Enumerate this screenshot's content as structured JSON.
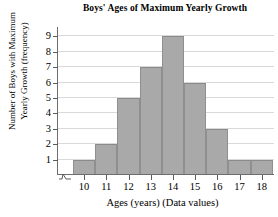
{
  "chart_data": {
    "type": "bar",
    "title": "Boys' Ages of Maximum Yearly Growth",
    "xlabel": "Ages (years) (Data values)",
    "ylabel_line1": "Number of Boys with Maximum",
    "ylabel_line2": "Yearly Growth (frequency)",
    "categories": [
      "10",
      "11",
      "12",
      "13",
      "14",
      "15",
      "16",
      "17",
      "18"
    ],
    "values": [
      1,
      2,
      5,
      7,
      9,
      6,
      3,
      1,
      1
    ],
    "yticks": [
      "1",
      "2",
      "3",
      "4",
      "5",
      "6",
      "7",
      "8",
      "9"
    ],
    "ylim": [
      0,
      9.6
    ],
    "grid": true,
    "legend": false,
    "axis_break": true,
    "bar_color": "#a9a9a9",
    "bar_border_color": "#8f8f8f",
    "grid_color": "#d9d9d9",
    "axis_color": "#6d6d6d",
    "text_color": "#000000"
  }
}
